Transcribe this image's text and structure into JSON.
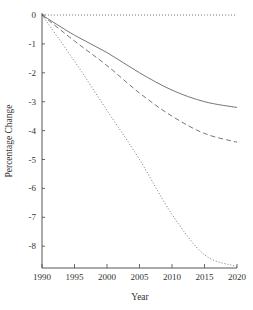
{
  "chart_data": {
    "type": "line",
    "title": "",
    "xlabel": "Year",
    "ylabel": "Percentage Change",
    "xlim": [
      1990,
      2020
    ],
    "ylim": [
      -8.7,
      0
    ],
    "grid": false,
    "legend": null,
    "x_ticks": [
      1990,
      1995,
      2000,
      2005,
      2010,
      2015,
      2020
    ],
    "y_ticks": [
      0,
      -1,
      -2,
      -3,
      -4,
      -5,
      -6,
      -7,
      -8
    ],
    "x": [
      1990,
      1995,
      2000,
      2005,
      2010,
      2015,
      2020
    ],
    "series": [
      {
        "name": "solid",
        "style": "solid",
        "values": [
          0,
          -0.7,
          -1.3,
          -2.0,
          -2.6,
          -3.0,
          -3.2
        ]
      },
      {
        "name": "dashed",
        "style": "dashed",
        "values": [
          0,
          -0.9,
          -1.75,
          -2.7,
          -3.5,
          -4.1,
          -4.4
        ]
      },
      {
        "name": "dotted",
        "style": "dotted",
        "values": [
          0,
          -1.6,
          -3.3,
          -5.0,
          -6.9,
          -8.3,
          -8.7
        ]
      },
      {
        "name": "zero-reference",
        "style": "dotted",
        "values": [
          0,
          0,
          0,
          0,
          0,
          0,
          0
        ]
      }
    ]
  },
  "colors": {
    "axis": "#444444",
    "line": "#666666",
    "text": "#333333"
  }
}
